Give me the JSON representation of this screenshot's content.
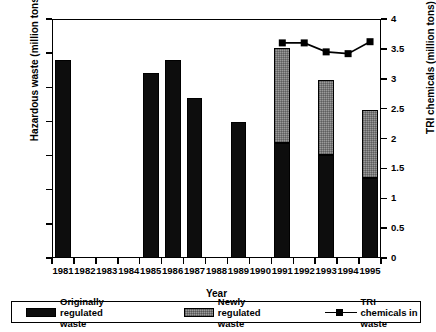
{
  "chart_data": {
    "type": "bar",
    "title": "",
    "xlabel": "Year",
    "ylabel": "Hazardous waste (million tons)",
    "ylabel_right": "TRI chemicals (million tons)",
    "categories": [
      "1981",
      "1982",
      "1983",
      "1984",
      "1985",
      "1986",
      "1987",
      "1988",
      "1989",
      "1990",
      "1991",
      "1992",
      "1993",
      "1994",
      "1995"
    ],
    "ylim": [
      0,
      350
    ],
    "yticks": [
      0,
      50,
      100,
      150,
      200,
      250,
      300,
      350
    ],
    "ylim_right": [
      0,
      4
    ],
    "yticks_right": [
      0,
      0.5,
      1,
      1.5,
      2,
      2.5,
      3,
      3.5,
      4
    ],
    "grid": false,
    "legend_position": "below",
    "series": [
      {
        "name": "Originally regulated waste",
        "axis": "left",
        "color": "#0d0d0d",
        "values": [
          290,
          null,
          null,
          null,
          271,
          290,
          235,
          null,
          199,
          null,
          168,
          null,
          151,
          null,
          117
        ]
      },
      {
        "name": "Newly regulated waste",
        "axis": "left",
        "color": "#9a9a9a",
        "values": [
          0,
          null,
          null,
          null,
          0,
          0,
          0,
          null,
          0,
          null,
          140,
          null,
          110,
          null,
          100
        ]
      },
      {
        "name": "TRI chemicals in waste",
        "axis": "right",
        "color": "#000000",
        "marker": "square",
        "values": [
          null,
          null,
          null,
          null,
          null,
          null,
          null,
          null,
          null,
          null,
          3.6,
          3.6,
          3.45,
          3.42,
          3.62
        ]
      }
    ],
    "totals_left": [
      290,
      null,
      null,
      null,
      271,
      290,
      235,
      null,
      199,
      null,
      308,
      null,
      261,
      null,
      217
    ]
  },
  "legend": {
    "items": [
      {
        "label": "Originally regulated waste",
        "swatch": "solid-black-swatch"
      },
      {
        "label": "Newly regulated waste",
        "swatch": "gray-hatch-swatch"
      },
      {
        "label": "TRI chemicals in waste",
        "swatch": "line-marker-swatch"
      }
    ]
  }
}
